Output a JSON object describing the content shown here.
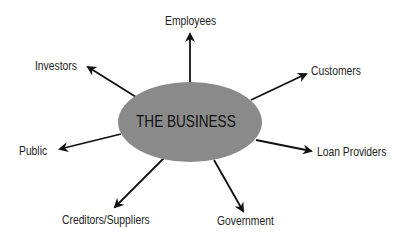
{
  "diagram": {
    "center": {
      "label": "THE BUSINESS",
      "fill": "#8a8a8a",
      "cx": 190,
      "cy": 122,
      "rx": 72,
      "ry": 40
    },
    "arrow_color": "#111111",
    "stakeholders": [
      {
        "id": "employees",
        "label": "Employees"
      },
      {
        "id": "customers",
        "label": "Customers"
      },
      {
        "id": "loan-providers",
        "label": "Loan Providers"
      },
      {
        "id": "government",
        "label": "Government"
      },
      {
        "id": "creditors-suppliers",
        "label": "Creditors/Suppliers"
      },
      {
        "id": "public",
        "label": "Public"
      },
      {
        "id": "investors",
        "label": "Investors"
      }
    ]
  }
}
